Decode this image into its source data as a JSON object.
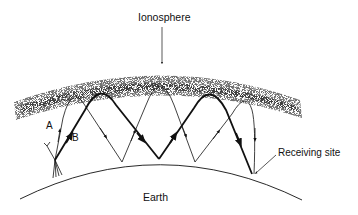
{
  "diagram": {
    "labels": {
      "ionosphere": "Ionosphere",
      "earth": "Earth",
      "receiving_site": "Receiving site",
      "path_a": "A",
      "path_b": "B"
    },
    "nodes": [
      {
        "id": "transmitter",
        "kind": "antenna",
        "x": 55,
        "y": 160
      },
      {
        "id": "receiver",
        "kind": "receiving-site",
        "x": 252,
        "y": 175
      }
    ],
    "paths": [
      {
        "id": "A",
        "style": "thin",
        "hops": 3,
        "ground_reflections": [
          [
            122,
            162
          ],
          [
            195,
            162
          ]
        ]
      },
      {
        "id": "B",
        "style": "thick",
        "hops": 2,
        "ground_reflections": [
          [
            159,
            159
          ]
        ]
      }
    ],
    "colors": {
      "ink": "#111111",
      "background": "#ffffff"
    }
  }
}
